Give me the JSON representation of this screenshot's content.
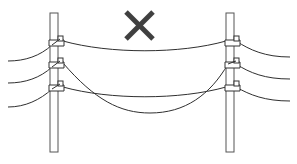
{
  "figure": {
    "caption": "Incorrect: sagging power line between two utility poles",
    "verdict_mark": "incorrect-x",
    "colors": {
      "background": "#ffffff",
      "line": "#2f2f2f",
      "pole_stroke": "#555555",
      "pole_fill": "#ffffff",
      "cross_mark": "#404040"
    },
    "poles": [
      {
        "id": "left-pole",
        "insulators": 3
      },
      {
        "id": "right-pole",
        "insulators": 3
      }
    ],
    "wires": [
      {
        "id": "top-wire",
        "sag": "slight"
      },
      {
        "id": "middle-wire",
        "sag": "excessive"
      },
      {
        "id": "bottom-wire",
        "sag": "slight"
      }
    ]
  }
}
